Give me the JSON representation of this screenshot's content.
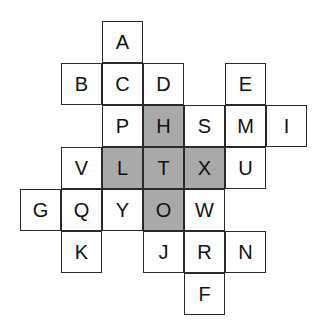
{
  "puzzle": {
    "cell_size": {
      "w": 41,
      "h": 42
    },
    "origin": {
      "x": 20,
      "y": 21
    },
    "colors": {
      "shaded": "#a9a9a9",
      "plain": "#ffffff",
      "border": "#2a2a2a"
    },
    "cells": [
      {
        "letter": "A",
        "row": 0,
        "col": 2,
        "shaded": false
      },
      {
        "letter": "B",
        "row": 1,
        "col": 1,
        "shaded": false
      },
      {
        "letter": "C",
        "row": 1,
        "col": 2,
        "shaded": false
      },
      {
        "letter": "D",
        "row": 1,
        "col": 3,
        "shaded": false
      },
      {
        "letter": "E",
        "row": 1,
        "col": 5,
        "shaded": false
      },
      {
        "letter": "P",
        "row": 2,
        "col": 2,
        "shaded": false
      },
      {
        "letter": "H",
        "row": 2,
        "col": 3,
        "shaded": true
      },
      {
        "letter": "S",
        "row": 2,
        "col": 4,
        "shaded": false
      },
      {
        "letter": "M",
        "row": 2,
        "col": 5,
        "shaded": false
      },
      {
        "letter": "I",
        "row": 2,
        "col": 6,
        "shaded": false
      },
      {
        "letter": "V",
        "row": 3,
        "col": 1,
        "shaded": false
      },
      {
        "letter": "L",
        "row": 3,
        "col": 2,
        "shaded": true
      },
      {
        "letter": "T",
        "row": 3,
        "col": 3,
        "shaded": true
      },
      {
        "letter": "X",
        "row": 3,
        "col": 4,
        "shaded": true
      },
      {
        "letter": "U",
        "row": 3,
        "col": 5,
        "shaded": false
      },
      {
        "letter": "G",
        "row": 4,
        "col": 0,
        "shaded": false
      },
      {
        "letter": "Q",
        "row": 4,
        "col": 1,
        "shaded": false
      },
      {
        "letter": "Y",
        "row": 4,
        "col": 2,
        "shaded": false
      },
      {
        "letter": "O",
        "row": 4,
        "col": 3,
        "shaded": true
      },
      {
        "letter": "W",
        "row": 4,
        "col": 4,
        "shaded": false
      },
      {
        "letter": "K",
        "row": 5,
        "col": 1,
        "shaded": false
      },
      {
        "letter": "J",
        "row": 5,
        "col": 3,
        "shaded": false
      },
      {
        "letter": "R",
        "row": 5,
        "col": 4,
        "shaded": false
      },
      {
        "letter": "N",
        "row": 5,
        "col": 5,
        "shaded": false
      },
      {
        "letter": "F",
        "row": 6,
        "col": 4,
        "shaded": false
      }
    ]
  }
}
